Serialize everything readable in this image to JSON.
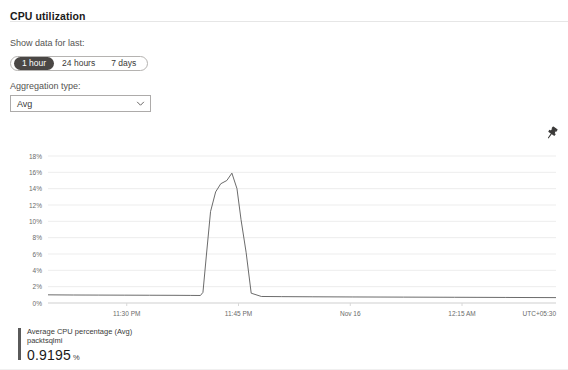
{
  "panel": {
    "title": "CPU utilization"
  },
  "controls": {
    "range_label": "Show data for last:",
    "range_options": [
      {
        "label": "1 hour",
        "selected": true
      },
      {
        "label": "24 hours",
        "selected": false
      },
      {
        "label": "7 days",
        "selected": false
      }
    ],
    "aggregation_label": "Aggregation type:",
    "aggregation_value": "Avg",
    "aggregation_options": [
      "Avg",
      "Min",
      "Max",
      "Sum",
      "Count"
    ],
    "chevron_icon": "chevron-down-icon"
  },
  "actions": {
    "pin_icon": "pin-icon",
    "pin_title": "Pin to dashboard"
  },
  "legend": {
    "series_title": "Average CPU percentage (Avg)",
    "resource_name": "packtsqlmi",
    "value": "0.9195",
    "unit": "%",
    "color": "#5a5a5a"
  },
  "chart_data": {
    "type": "line",
    "title": "CPU utilization",
    "xlabel": "",
    "ylabel": "",
    "timezone": "UTC+05:30",
    "grid": true,
    "legend_position": "bottom-left",
    "ylim": [
      0,
      18
    ],
    "ytick_labels": [
      "18%",
      "16%",
      "14%",
      "12%",
      "10%",
      "8%",
      "6%",
      "4%",
      "2%",
      "0%"
    ],
    "ytick_values": [
      18,
      16,
      14,
      12,
      10,
      8,
      6,
      4,
      2,
      0
    ],
    "xtick_labels": [
      "11:30 PM",
      "11:45 PM",
      "Nov 16",
      "12:15 AM"
    ],
    "xtick_positions": [
      0.155,
      0.375,
      0.595,
      0.815
    ],
    "series": [
      {
        "name": "Average CPU percentage (Avg)",
        "color": "#5a5a5a",
        "unit": "%",
        "x": [
          0.0,
          0.05,
          0.1,
          0.15,
          0.2,
          0.25,
          0.28,
          0.3,
          0.305,
          0.312,
          0.32,
          0.33,
          0.34,
          0.352,
          0.362,
          0.372,
          0.38,
          0.39,
          0.4,
          0.42,
          0.46,
          0.52,
          0.6,
          0.7,
          0.8,
          0.9,
          1.0
        ],
        "y": [
          1.0,
          0.98,
          0.97,
          0.96,
          0.95,
          0.94,
          0.93,
          0.92,
          1.3,
          6.0,
          11.2,
          13.6,
          14.6,
          15.0,
          15.9,
          14.0,
          10.2,
          6.2,
          1.2,
          0.8,
          0.78,
          0.76,
          0.74,
          0.72,
          0.7,
          0.68,
          0.66
        ]
      }
    ],
    "peak_value": 15.9,
    "baseline_value": 0.92,
    "current_value": 0.9195
  }
}
